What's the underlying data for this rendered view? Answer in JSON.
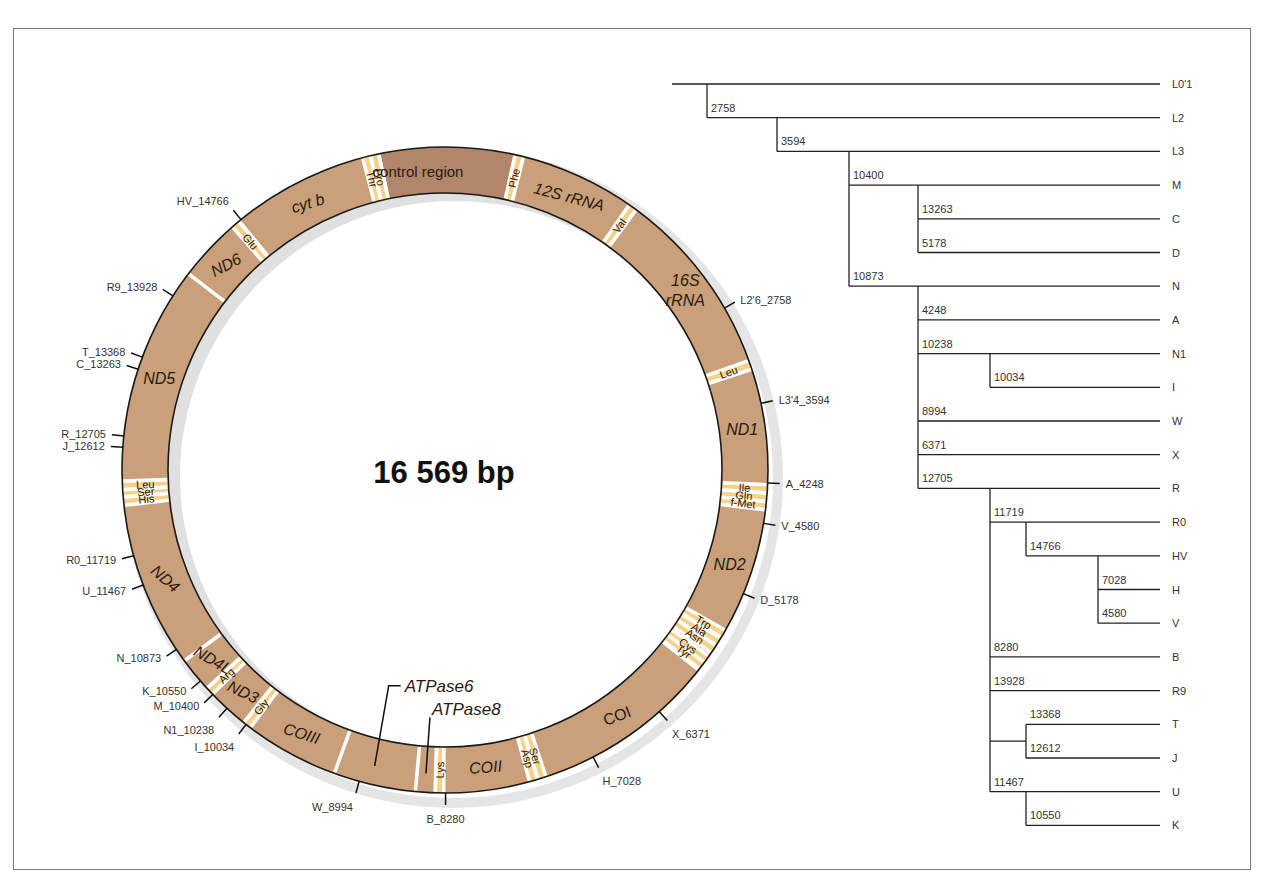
{
  "genome": {
    "size_bp": 16569,
    "center_label": "16 569 bp",
    "colors": {
      "gene": "#c9a079",
      "control_region": "#b2866a",
      "trna": "#f5d28a",
      "separator": "#ffffff",
      "outline": "#1a1a1a"
    },
    "segments": [
      {
        "label": "control region",
        "start": 16024,
        "end": 576,
        "kind": "control",
        "italic": false,
        "label_at": 0
      },
      {
        "label": "Phe",
        "start": 577,
        "end": 647,
        "kind": "trna"
      },
      {
        "label": "12S rRNA",
        "start": 648,
        "end": 1601,
        "kind": "gene",
        "italic": true
      },
      {
        "label": "Val",
        "start": 1602,
        "end": 1670,
        "kind": "trna"
      },
      {
        "label": "16S rRNA",
        "start": 1671,
        "end": 3229,
        "kind": "gene",
        "italic": true,
        "multiline": [
          "16S",
          "rRNA"
        ]
      },
      {
        "label": "Leu",
        "start": 3230,
        "end": 3304,
        "kind": "trna"
      },
      {
        "label": "ND1",
        "start": 3307,
        "end": 4262,
        "kind": "gene",
        "italic": true
      },
      {
        "label": "Ile",
        "start": 4263,
        "end": 4331,
        "kind": "trna"
      },
      {
        "label": "Gln",
        "start": 4332,
        "end": 4400,
        "kind": "trna"
      },
      {
        "label": "f-Met",
        "start": 4402,
        "end": 4469,
        "kind": "trna"
      },
      {
        "label": "ND2",
        "start": 4470,
        "end": 5511,
        "kind": "gene",
        "italic": true
      },
      {
        "label": "Trp",
        "start": 5512,
        "end": 5579,
        "kind": "trna"
      },
      {
        "label": "Ala",
        "start": 5587,
        "end": 5655,
        "kind": "trna"
      },
      {
        "label": "Asn",
        "start": 5657,
        "end": 5729,
        "kind": "trna"
      },
      {
        "label": "",
        "start": 5730,
        "end": 5760,
        "kind": "gene"
      },
      {
        "label": "Cys",
        "start": 5761,
        "end": 5826,
        "kind": "trna"
      },
      {
        "label": "Tyr",
        "start": 5826,
        "end": 5891,
        "kind": "trna"
      },
      {
        "label": "COI",
        "start": 5904,
        "end": 7445,
        "kind": "gene",
        "italic": false
      },
      {
        "label": "Ser",
        "start": 7446,
        "end": 7514,
        "kind": "trna"
      },
      {
        "label": "Asp",
        "start": 7518,
        "end": 7585,
        "kind": "trna"
      },
      {
        "label": "COII",
        "start": 7586,
        "end": 8269,
        "kind": "gene",
        "italic": true
      },
      {
        "label": "Lys",
        "start": 8295,
        "end": 8364,
        "kind": "trna"
      },
      {
        "label": "",
        "start": 8366,
        "end": 8572,
        "kind": "gene"
      },
      {
        "label": "",
        "start": 8527,
        "end": 9207,
        "kind": "gene"
      },
      {
        "label": "COIII",
        "start": 9207,
        "end": 9990,
        "kind": "gene",
        "italic": true
      },
      {
        "label": "Gly",
        "start": 9991,
        "end": 10058,
        "kind": "trna"
      },
      {
        "label": "ND3",
        "start": 10059,
        "end": 10404,
        "kind": "gene",
        "italic": true
      },
      {
        "label": "Arg",
        "start": 10405,
        "end": 10469,
        "kind": "trna"
      },
      {
        "label": "ND4L",
        "start": 10470,
        "end": 10766,
        "kind": "gene",
        "italic": true
      },
      {
        "label": "ND4",
        "start": 10760,
        "end": 12137,
        "kind": "gene",
        "italic": true
      },
      {
        "label": "His",
        "start": 12138,
        "end": 12206,
        "kind": "trna"
      },
      {
        "label": "Ser",
        "start": 12207,
        "end": 12265,
        "kind": "trna"
      },
      {
        "label": "Leu",
        "start": 12266,
        "end": 12336,
        "kind": "trna"
      },
      {
        "label": "ND5",
        "start": 12337,
        "end": 14148,
        "kind": "gene",
        "italic": true
      },
      {
        "label": "ND6",
        "start": 14149,
        "end": 14673,
        "kind": "gene",
        "italic": true
      },
      {
        "label": "Glu",
        "start": 14674,
        "end": 14742,
        "kind": "trna"
      },
      {
        "label": "cyt b",
        "start": 14747,
        "end": 15887,
        "kind": "gene",
        "italic": true
      },
      {
        "label": "Thr",
        "start": 15888,
        "end": 15953,
        "kind": "trna"
      },
      {
        "label": "Pro",
        "start": 15956,
        "end": 16023,
        "kind": "trna"
      }
    ],
    "callouts": [
      {
        "label": "ATPase6",
        "italic": true
      },
      {
        "label": "ATPase8",
        "italic": true
      }
    ],
    "markers": [
      {
        "label": "L2'6_2758",
        "position": 2758
      },
      {
        "label": "L3'4_3594",
        "position": 3594
      },
      {
        "label": "A_4248",
        "position": 4248
      },
      {
        "label": "V_4580",
        "position": 4580
      },
      {
        "label": "D_5178",
        "position": 5178
      },
      {
        "label": "X_6371",
        "position": 6371
      },
      {
        "label": "H_7028",
        "position": 7028
      },
      {
        "label": "B_8280",
        "position": 8280
      },
      {
        "label": "W_8994",
        "position": 8994
      },
      {
        "label": "I_10034",
        "position": 10034
      },
      {
        "label": "N1_10238",
        "position": 10238
      },
      {
        "label": "M_10400",
        "position": 10400
      },
      {
        "label": "K_10550",
        "position": 10550
      },
      {
        "label": "N_10873",
        "position": 10873
      },
      {
        "label": "U_11467",
        "position": 11467
      },
      {
        "label": "R0_11719",
        "position": 11719
      },
      {
        "label": "J_12612",
        "position": 12612
      },
      {
        "label": "R_12705",
        "position": 12705
      },
      {
        "label": "C_13263",
        "position": 13263
      },
      {
        "label": "T_13368",
        "position": 13368
      },
      {
        "label": "R9_13928",
        "position": 13928
      },
      {
        "label": "HV_14766",
        "position": 14766
      }
    ]
  },
  "tree": {
    "leaves": [
      "L0'1",
      "L2",
      "L3",
      "M",
      "C",
      "D",
      "N",
      "A",
      "N1",
      "I",
      "W",
      "X",
      "R",
      "R0",
      "HV",
      "H",
      "V",
      "B",
      "R9",
      "T",
      "J",
      "U",
      "K"
    ],
    "branches": [
      {
        "label": "",
        "depth": 0,
        "leaf_rows": [
          0
        ]
      },
      {
        "label": "2758",
        "depth": 1,
        "row": 1
      },
      {
        "label": "3594",
        "depth": 2,
        "row": 2
      },
      {
        "label": "10400",
        "depth": 3,
        "row": 3
      },
      {
        "label": "13263",
        "depth": 4,
        "row": 4
      },
      {
        "label": "5178",
        "depth": 4,
        "row": 5
      },
      {
        "label": "10873",
        "depth": 3,
        "row": 6
      },
      {
        "label": "4248",
        "depth": 4,
        "row": 7
      },
      {
        "label": "10238",
        "depth": 4,
        "row": 8
      },
      {
        "label": "10034",
        "depth": 5,
        "row": 9
      },
      {
        "label": "8994",
        "depth": 4,
        "row": 10
      },
      {
        "label": "6371",
        "depth": 4,
        "row": 11
      },
      {
        "label": "12705",
        "depth": 4,
        "row": 12
      },
      {
        "label": "11719",
        "depth": 5,
        "row": 13
      },
      {
        "label": "14766",
        "depth": 6,
        "row": 14
      },
      {
        "label": "7028",
        "depth": 7,
        "row": 15
      },
      {
        "label": "4580",
        "depth": 7,
        "row": 16
      },
      {
        "label": "8280",
        "depth": 5,
        "row": 17
      },
      {
        "label": "13928",
        "depth": 5,
        "row": 18
      },
      {
        "label": "13368",
        "depth": 6,
        "row": 19
      },
      {
        "label": "12612",
        "depth": 6,
        "row": 20
      },
      {
        "label": "11467",
        "depth": 5,
        "row": 21
      },
      {
        "label": "10550",
        "depth": 6,
        "row": 22
      }
    ]
  }
}
